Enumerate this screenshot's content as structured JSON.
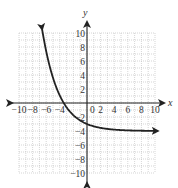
{
  "chart_data": {
    "type": "line",
    "title": "",
    "xlabel": "x",
    "ylabel": "y",
    "xlim": [
      -10,
      10
    ],
    "ylim": [
      -10,
      10
    ],
    "grid": true,
    "x_ticks": [
      "-10",
      "-8",
      "-6",
      "-4",
      "2",
      "4",
      "6",
      "8",
      "10"
    ],
    "y_ticks": [
      "10",
      "8",
      "6",
      "4",
      "2",
      "-2",
      "-4",
      "-6",
      "-8",
      "-10"
    ],
    "origin_label": "0",
    "series": [
      {
        "name": "curve",
        "function": "y = 1.5^(-x) - 4",
        "asymptote": -4,
        "x": [
          -6.5,
          -6,
          -5,
          -4,
          -3.42,
          -3,
          -2,
          -1,
          0,
          2,
          4,
          6,
          8,
          10
        ],
        "y": [
          9.9,
          7.4,
          3.6,
          1.06,
          0,
          -0.62,
          -1.75,
          -2.5,
          -3,
          -3.56,
          -3.8,
          -3.91,
          -3.96,
          -3.98
        ],
        "arrows": "both"
      }
    ]
  },
  "labels": {
    "x_axis": "x",
    "y_axis": "y",
    "origin": "0"
  }
}
